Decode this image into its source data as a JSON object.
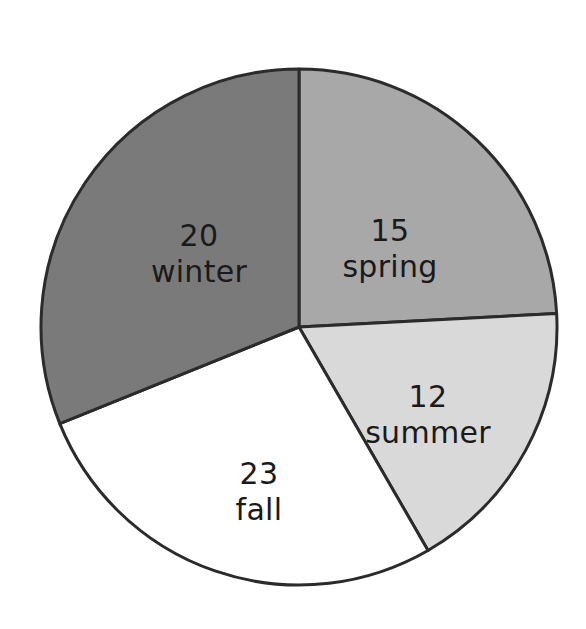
{
  "canvas": {
    "width": 586,
    "height": 629,
    "background": "#ffffff"
  },
  "figure": {
    "center_x": 299,
    "center_y": 327,
    "radius": 258,
    "stroke_color": "#2b2b2b",
    "stroke_width": 3,
    "text_color": "#1a1a1a"
  },
  "chart_data": {
    "type": "pie",
    "title": "",
    "subtitle": "",
    "xlabel": "",
    "ylabel": "",
    "total": 70,
    "start_angle_deg": 0,
    "direction": "clockwise",
    "grid": false,
    "legend": "none",
    "labels_inside_slices": true,
    "categories": [
      "spring",
      "summer",
      "fall",
      "winter"
    ],
    "values": [
      15,
      12,
      23,
      20
    ],
    "colors": [
      "#a8a8a8",
      "#d9d9d9",
      "#ffffff",
      "#7a7a7a"
    ],
    "slices": [
      {
        "name": "spring",
        "value": 15,
        "label_value": "15",
        "label_name": "spring",
        "color": "#a8a8a8",
        "start_deg": 0,
        "end_deg": 87,
        "sweep_deg": 87,
        "percent": 21.4,
        "label_x": 390,
        "label_y": 232
      },
      {
        "name": "summer",
        "value": 12,
        "label_value": "12",
        "label_name": "summer",
        "color": "#d9d9d9",
        "start_deg": 87,
        "end_deg": 150,
        "sweep_deg": 63,
        "percent": 17.1,
        "label_x": 428,
        "label_y": 398
      },
      {
        "name": "fall",
        "value": 23,
        "label_value": "23",
        "label_name": "fall",
        "color": "#ffffff",
        "start_deg": 150,
        "end_deg": 248,
        "sweep_deg": 98,
        "percent": 32.9,
        "label_x": 259,
        "label_y": 475
      },
      {
        "name": "winter",
        "value": 20,
        "label_value": "20",
        "label_name": "winter",
        "color": "#7a7a7a",
        "start_deg": 248,
        "end_deg": 360,
        "sweep_deg": 112,
        "percent": 28.6,
        "label_x": 199,
        "label_y": 237
      }
    ]
  }
}
